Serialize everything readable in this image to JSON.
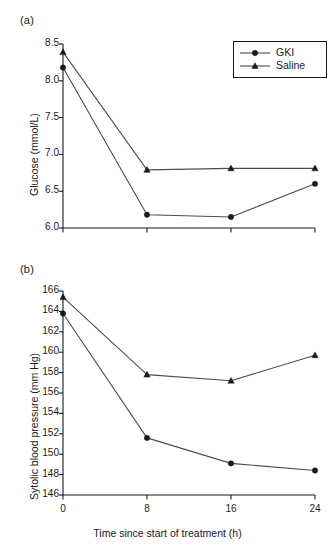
{
  "figure": {
    "background": "#ffffff",
    "ink": "#1a1a1a",
    "line_color": "#4d4d4d",
    "marker_color": "#1a1a1a"
  },
  "panels": [
    {
      "label": "(a)",
      "chart_ref": 0
    },
    {
      "label": "(b)",
      "chart_ref": 1
    }
  ],
  "legend": {
    "position": "upper-right-panel-a",
    "entries": [
      {
        "label": "GKI",
        "marker": "circle"
      },
      {
        "label": "Saline",
        "marker": "triangle"
      }
    ]
  },
  "chart_data": [
    {
      "type": "line",
      "title": "(a)",
      "xlabel": "",
      "ylabel": "Glucose (mmol/L)",
      "x": [
        0,
        8,
        16,
        24
      ],
      "xticklabels": [
        "",
        "",
        "",
        ""
      ],
      "xlim": [
        0,
        24
      ],
      "ylim": [
        6.0,
        8.5
      ],
      "yticks": [
        6.0,
        6.5,
        7.0,
        7.5,
        8.0,
        8.5
      ],
      "yticklabels": [
        "6.0",
        "6.5",
        "7.0",
        "7.5",
        "8.0",
        "8.5"
      ],
      "grid": false,
      "legend": [
        "GKI",
        "Saline"
      ],
      "series": [
        {
          "name": "GKI",
          "marker": "circle",
          "values": [
            8.18,
            6.18,
            6.15,
            6.6
          ]
        },
        {
          "name": "Saline",
          "marker": "triangle",
          "values": [
            8.39,
            6.79,
            6.81,
            6.81
          ]
        }
      ]
    },
    {
      "type": "line",
      "title": "(b)",
      "xlabel": "Time since start of treatment (h)",
      "ylabel": "Sytolic blood pressure (mm Hg)",
      "x": [
        0,
        8,
        16,
        24
      ],
      "xticks": [
        0,
        8,
        16,
        24
      ],
      "xticklabels": [
        "0",
        "8",
        "16",
        "24"
      ],
      "xlim": [
        0,
        24
      ],
      "ylim": [
        146,
        166
      ],
      "yticks": [
        146,
        148,
        150,
        152,
        154,
        156,
        158,
        160,
        162,
        164,
        166
      ],
      "yticklabels": [
        "146",
        "148",
        "150",
        "152",
        "154",
        "156",
        "158",
        "160",
        "162",
        "164",
        "166"
      ],
      "grid": false,
      "legend": [],
      "series": [
        {
          "name": "GKI",
          "marker": "circle",
          "values": [
            163.8,
            151.6,
            149.1,
            148.4
          ]
        },
        {
          "name": "Saline",
          "marker": "triangle",
          "values": [
            165.4,
            157.8,
            157.2,
            159.7
          ]
        }
      ]
    }
  ]
}
